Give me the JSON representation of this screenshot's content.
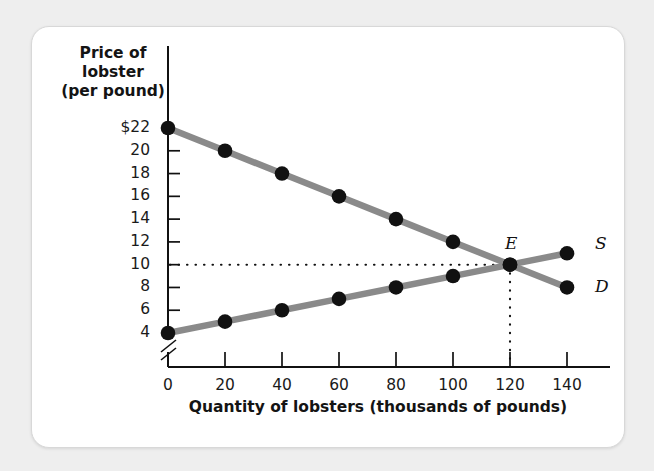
{
  "figure": {
    "y_axis_title": "Price of\nlobster\n(per pound)",
    "y_axis_title_lines": [
      "Price of",
      "lobster",
      "(per pound)"
    ],
    "x_axis_title": "Quantity of lobsters (thousands of pounds)",
    "equilibrium_label": "E",
    "supply_label": "S",
    "demand_label": "D"
  },
  "colors": {
    "curve": "#8a8a8a",
    "point": "#111111",
    "axis": "#111111",
    "text": "#141414",
    "card_bg": "#ffffff",
    "page_bg": "#eeeeee"
  },
  "chart_data": {
    "type": "line",
    "title": "",
    "xlabel": "Quantity of lobsters (thousands of pounds)",
    "ylabel": "Price of lobster (per pound)",
    "x": [
      0,
      20,
      40,
      60,
      80,
      100,
      120,
      140
    ],
    "xtick_labels": [
      "0",
      "20",
      "40",
      "60",
      "80",
      "100",
      "120",
      "140"
    ],
    "ytick_labels": [
      "$22",
      "20",
      "18",
      "16",
      "14",
      "12",
      "10",
      "8",
      "6",
      "4"
    ],
    "ytick_values": [
      22,
      20,
      18,
      16,
      14,
      12,
      10,
      8,
      6,
      4
    ],
    "xlim": [
      0,
      150
    ],
    "ylim": [
      4,
      22
    ],
    "y_axis_break": true,
    "grid": false,
    "legend_position": "curve-end-labels",
    "series": [
      {
        "name": "D",
        "full_name": "Demand",
        "values": [
          22,
          20,
          18,
          16,
          14,
          12,
          10,
          8
        ],
        "markers": true
      },
      {
        "name": "S",
        "full_name": "Supply",
        "values": [
          4,
          5,
          6,
          7,
          8,
          9,
          10,
          11
        ],
        "markers": true
      }
    ],
    "annotations": [
      {
        "label": "E",
        "type": "equilibrium",
        "x": 120,
        "y": 10,
        "guides": [
          "horizontal-dotted-to-y-axis",
          "vertical-dotted-to-x-axis"
        ]
      }
    ]
  }
}
